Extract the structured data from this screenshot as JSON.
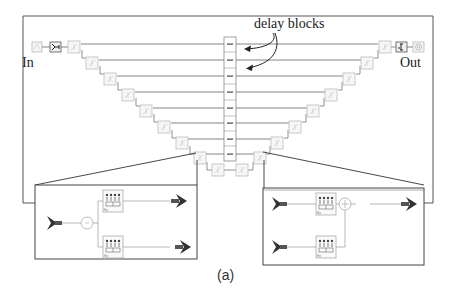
{
  "figure": {
    "caption": "(a)",
    "annotation": "delay blocks",
    "input_label": "In",
    "output_label": "Out",
    "colors": {
      "frame": "#555555",
      "wire": "#666666",
      "block_border": "#bdbdbd",
      "arrow": "#333333",
      "port": "#444444",
      "text": "#222222"
    }
  },
  "structure": {
    "delay_column": {
      "cells": 9,
      "icon": "delay-block-icon"
    },
    "left_staircase": {
      "blocks": 8,
      "icon": "split-block-icon"
    },
    "right_staircase": {
      "blocks": 8,
      "icon": "combine-block-icon"
    },
    "input_chain": [
      "source-icon",
      "gain-icon"
    ],
    "output_chain": [
      "gain-icon",
      "scope-icon"
    ]
  },
  "insets": [
    {
      "name": "split-block-detail",
      "components": [
        "input-port-icon",
        "sum-node-icon",
        "filter-block-icon",
        "filter-block-icon",
        "output-port-icon",
        "output-port-icon"
      ]
    },
    {
      "name": "combine-block-detail",
      "components": [
        "input-port-icon",
        "input-port-icon",
        "filter-block-icon",
        "filter-block-icon",
        "adder-node-icon",
        "output-port-icon"
      ]
    }
  ]
}
